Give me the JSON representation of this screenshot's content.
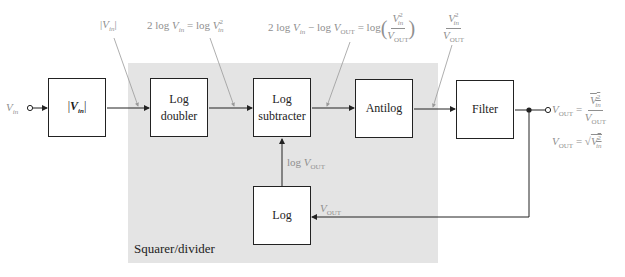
{
  "input_label": "V_in",
  "blocks": {
    "abs": {
      "label": "|V_in|"
    },
    "log_doubler": {
      "label_line1": "Log",
      "label_line2": "doubler"
    },
    "log_subtracter": {
      "label_line1": "Log",
      "label_line2": "subtracter"
    },
    "antilog": {
      "label": "Antilog"
    },
    "filter": {
      "label": "Filter"
    },
    "log": {
      "label": "Log"
    }
  },
  "region_label": "Squarer/divider",
  "annotations": {
    "abs_output": "|V_in|",
    "doubler_output": "2 log V_in = log V_in^2",
    "subtracter_output": "2 log V_in − log V_OUT = log(V_in^2 / V_OUT)",
    "antilog_output": "V_in^2 / V_OUT",
    "log_output": "log V_OUT",
    "feedback": "V_OUT",
    "output_eq1": "V_OUT = avg(V_in^2) / V_OUT",
    "output_eq2": "V_OUT = sqrt(avg(V_in^2))"
  },
  "colors": {
    "annotation": "#8f8f8f",
    "region_fill": "#e4e4e4",
    "line": "#222222"
  }
}
